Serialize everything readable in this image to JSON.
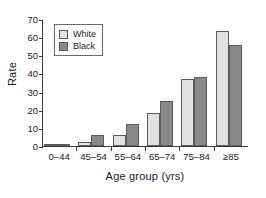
{
  "chart_data": {
    "type": "bar",
    "title": "",
    "subtitle": "",
    "xlabel": "Age group (yrs)",
    "ylabel": "Rate",
    "categories": [
      "0–44",
      "45–54",
      "55–64",
      "65–74",
      "75–84",
      "≥85"
    ],
    "series": [
      {
        "name": "White",
        "color": "#e2e2e2",
        "values": [
          0.5,
          2,
          6,
          18.5,
          37.5,
          64
        ]
      },
      {
        "name": "Black",
        "color": "#888888",
        "values": [
          1,
          6,
          12,
          25,
          38.5,
          56
        ]
      }
    ],
    "ylim": [
      0,
      70
    ],
    "ytick_labels": [
      "70",
      "60",
      "50",
      "40",
      "30",
      "20",
      "10",
      "0"
    ],
    "ytick_values": [
      70,
      60,
      50,
      40,
      30,
      20,
      10,
      0
    ],
    "ystep": 10,
    "grid": false,
    "legend_position": "upper left",
    "legend_entries": [
      "White",
      "Black"
    ],
    "bar_border_color": "#5b5b5b",
    "axis_color": "#3a3a3a"
  }
}
